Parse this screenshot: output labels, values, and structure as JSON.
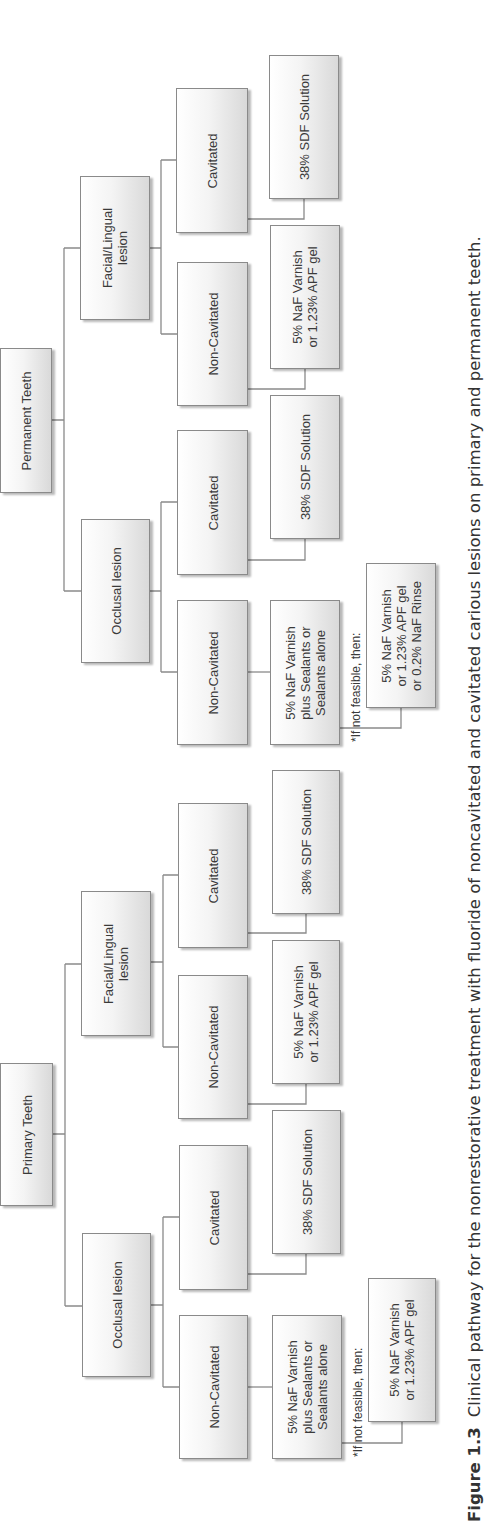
{
  "orientation": "rotated 90° counter-clockwise",
  "caption": {
    "label": "Figure 1.3",
    "text": "Clinical pathway for the nonrestorative treatment with fluoride of noncavitated and cavitated carious lesions on primary and permanent teeth."
  },
  "trees": {
    "permanent": {
      "root": "Permanent Teeth",
      "facial_lingual": {
        "label": [
          "Facial/Lingual",
          "lesion"
        ],
        "cavitated": {
          "label": "Cavitated",
          "treatment": [
            "38% SDF Solution"
          ]
        },
        "non_cavitated": {
          "label": "Non-Cavitated",
          "treatment": [
            "5% NaF Varnish",
            "or 1.23% APF gel"
          ]
        }
      },
      "occlusal": {
        "label": [
          "Occlusal lesion"
        ],
        "cavitated": {
          "label": "Cavitated",
          "treatment": [
            "38% SDF Solution"
          ]
        },
        "non_cavitated": {
          "label": "Non-Cavitated",
          "treatment": [
            "5% NaF Varnish",
            "plus Sealants or",
            "Sealants alone"
          ],
          "fallback_note": "*If not feasible, then:",
          "fallback": [
            "5% NaF Varnish",
            "or 1.23% APF gel",
            "or 0.2% NaF Rinse"
          ]
        }
      }
    },
    "primary": {
      "root": "Primary Teeth",
      "facial_lingual": {
        "label": [
          "Facial/Lingual",
          "lesion"
        ],
        "cavitated": {
          "label": "Cavitated",
          "treatment": [
            "38% SDF Solution"
          ]
        },
        "non_cavitated": {
          "label": "Non-Cavitated",
          "treatment": [
            "5% NaF Varnish",
            "or 1.23% APF gel"
          ]
        }
      },
      "occlusal": {
        "label": [
          "Occlusal lesion"
        ],
        "cavitated": {
          "label": "Cavitated",
          "treatment": [
            "38% SDF Solution"
          ]
        },
        "non_cavitated": {
          "label": "Non-Cavitated",
          "treatment": [
            "5% NaF Varnish",
            "plus Sealants or",
            "Sealants alone"
          ],
          "fallback_note": "*If not feasible, then:",
          "fallback": [
            "5% NaF Varnish",
            "or 1.23% APF gel"
          ]
        }
      }
    }
  },
  "colors": {
    "line": "#8a8a8a",
    "text": "#3a3a3a",
    "box_shade": "#d9d9d9"
  }
}
